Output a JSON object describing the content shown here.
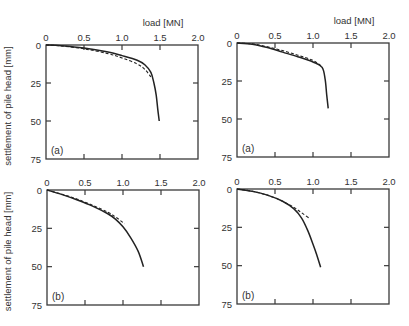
{
  "chart_data": [
    {
      "type": "line",
      "id": "top-left",
      "panel_label": "(a)",
      "xlabel": "load [MN]",
      "ylabel": "settlement of pile head [mm]",
      "xlim": [
        0,
        2.0
      ],
      "ylim": [
        0,
        75
      ],
      "y_inverted": true,
      "x_axis_position": "top",
      "xticks": [
        "0",
        "0.5",
        "1.0",
        "1.5",
        "2.0"
      ],
      "yticks": [
        "0",
        "25",
        "50",
        "75"
      ],
      "series": [
        {
          "name": "solid",
          "style": "solid",
          "x": [
            0,
            0.2,
            0.5,
            0.8,
            1.0,
            1.2,
            1.3,
            1.38,
            1.42,
            1.45,
            1.47,
            1.49
          ],
          "y": [
            0,
            0.5,
            2,
            4.5,
            7,
            10,
            13,
            18,
            25,
            33,
            42,
            50
          ]
        },
        {
          "name": "dashed",
          "style": "dashed",
          "x": [
            0,
            0.2,
            0.5,
            0.8,
            1.0,
            1.2,
            1.3,
            1.38
          ],
          "y": [
            0,
            0.6,
            2.5,
            5.5,
            8.5,
            12.5,
            16,
            21
          ]
        }
      ]
    },
    {
      "type": "line",
      "id": "top-right",
      "panel_label": "(a)",
      "xlabel": "load [MN]",
      "ylabel": "",
      "xlim": [
        0,
        2.0
      ],
      "ylim": [
        0,
        75
      ],
      "y_inverted": true,
      "x_axis_position": "top",
      "xticks": [
        "0",
        "0.5",
        "1.0",
        "1.5",
        "2.0"
      ],
      "yticks": [
        "0",
        "25",
        "50",
        "75"
      ],
      "series": [
        {
          "name": "solid",
          "style": "solid",
          "x": [
            0,
            0.2,
            0.4,
            0.6,
            0.8,
            1.0,
            1.12,
            1.16,
            1.18,
            1.2
          ],
          "y": [
            0,
            0.8,
            3,
            6,
            9,
            12.5,
            16,
            24,
            34,
            43
          ]
        },
        {
          "name": "dashed",
          "style": "dashed",
          "x": [
            0,
            0.2,
            0.4,
            0.6,
            0.8,
            1.0,
            1.13
          ],
          "y": [
            0,
            0.6,
            2.5,
            5,
            8,
            11.5,
            16
          ]
        }
      ]
    },
    {
      "type": "line",
      "id": "bottom-left",
      "panel_label": "(b)",
      "xlabel": "",
      "ylabel": "settlement of pile head [mm]",
      "xlim": [
        0,
        2.0
      ],
      "ylim": [
        0,
        75
      ],
      "y_inverted": true,
      "x_axis_position": "top",
      "xticks": [
        "0",
        "0.5",
        "1.0",
        "1.5",
        "2.0"
      ],
      "yticks": [
        "0",
        "25",
        "50",
        "75"
      ],
      "series": [
        {
          "name": "solid",
          "style": "solid",
          "x": [
            0,
            0.2,
            0.4,
            0.6,
            0.8,
            0.9,
            1.0,
            1.1,
            1.2,
            1.27
          ],
          "y": [
            0,
            3,
            6.5,
            10.5,
            15.5,
            19,
            24,
            31,
            40,
            50
          ]
        },
        {
          "name": "dashed",
          "style": "dashed",
          "x": [
            0,
            0.2,
            0.4,
            0.6,
            0.8,
            0.9,
            1.02
          ],
          "y": [
            0,
            2.8,
            6,
            10,
            14.5,
            17.5,
            22
          ]
        }
      ]
    },
    {
      "type": "line",
      "id": "bottom-right",
      "panel_label": "(b)",
      "xlabel": "",
      "ylabel": "",
      "xlim": [
        0,
        2.0
      ],
      "ylim": [
        0,
        75
      ],
      "y_inverted": true,
      "x_axis_position": "top",
      "xticks": [
        "0",
        "0.5",
        "1.0",
        "1.5",
        "2.0"
      ],
      "yticks": [
        "0",
        "25",
        "50",
        "75"
      ],
      "series": [
        {
          "name": "solid",
          "style": "solid",
          "x": [
            0,
            0.2,
            0.4,
            0.6,
            0.75,
            0.85,
            0.93,
            1.0,
            1.05,
            1.1
          ],
          "y": [
            0,
            1.5,
            4,
            8,
            13,
            19,
            27,
            36,
            43,
            51
          ]
        },
        {
          "name": "dashed",
          "style": "dashed",
          "x": [
            0,
            0.2,
            0.4,
            0.6,
            0.75,
            0.85,
            0.95
          ],
          "y": [
            0,
            1.5,
            4,
            8,
            12,
            15.5,
            19
          ]
        }
      ]
    }
  ],
  "panels_layout": [
    {
      "x0": 46,
      "x1": 198,
      "y0": 45,
      "y1": 159,
      "show_ylabel": true,
      "show_xlabel": true
    },
    {
      "x0": 237,
      "x1": 389,
      "y0": 43,
      "y1": 157,
      "show_ylabel": false,
      "show_xlabel": true
    },
    {
      "x0": 47,
      "x1": 199,
      "y0": 190,
      "y1": 305,
      "show_ylabel": true,
      "show_xlabel": false
    },
    {
      "x0": 237,
      "x1": 389,
      "y0": 189,
      "y1": 304,
      "show_ylabel": false,
      "show_xlabel": false
    }
  ]
}
